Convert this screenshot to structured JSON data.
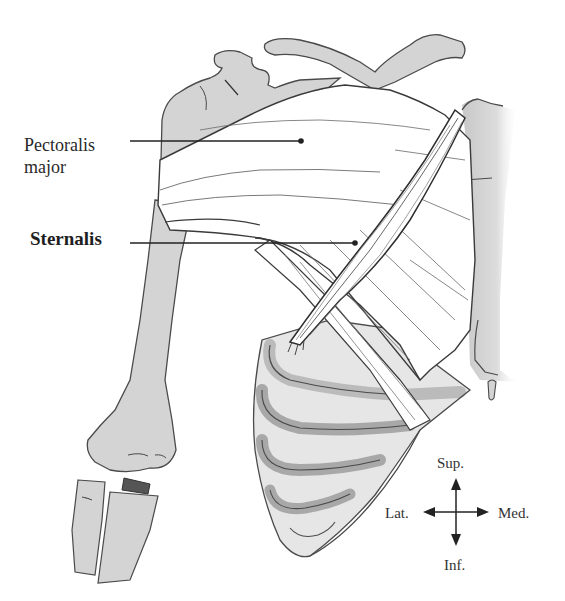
{
  "figure": {
    "labels": {
      "pectoralis_major_line1": "Pectoralis",
      "pectoralis_major_line2": "major",
      "sternalis": "Sternalis"
    },
    "orientation": {
      "superior": "Sup.",
      "inferior": "Inf.",
      "lateral": "Lat.",
      "medial": "Med."
    },
    "colors": {
      "bone": "#d4d4d4",
      "bone_outline": "#4a4a4a",
      "muscle": "#ffffff",
      "muscle_fiber": "#6a6a6a",
      "leader_line": "#222222",
      "background": "#ffffff"
    }
  }
}
